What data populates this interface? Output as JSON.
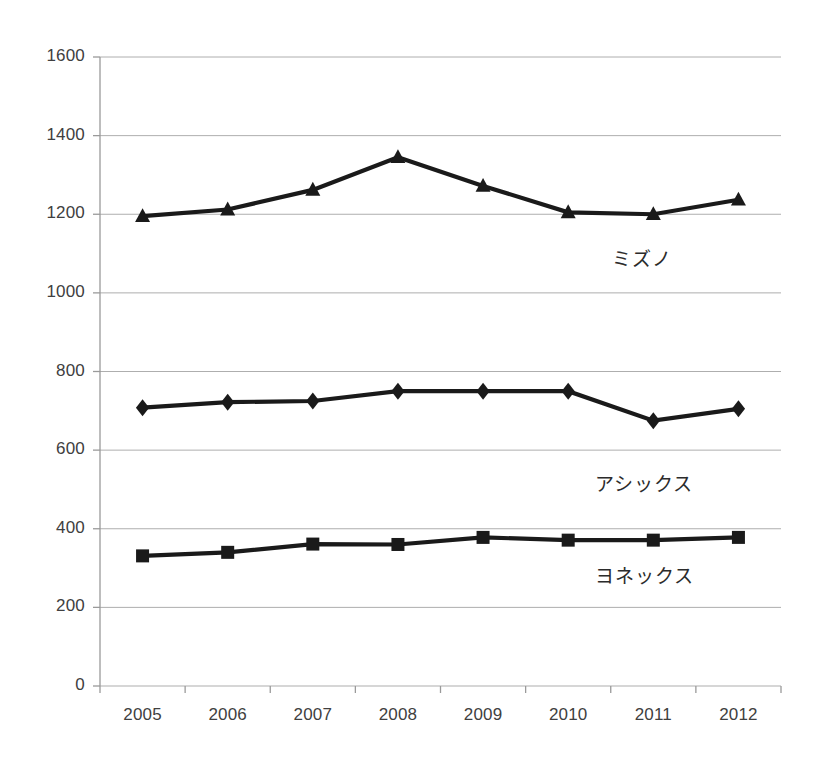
{
  "chart_data": {
    "type": "line",
    "title": "",
    "subtitle": "",
    "xlabel": "",
    "ylabel": "",
    "categories": [
      "2005",
      "2006",
      "2007",
      "2008",
      "2009",
      "2010",
      "2011",
      "2012"
    ],
    "x": [
      2005,
      2006,
      2007,
      2008,
      2009,
      2010,
      2011,
      2012
    ],
    "ylim": [
      0,
      1600
    ],
    "yticks": [
      0,
      200,
      400,
      600,
      800,
      1000,
      1200,
      1400,
      1600
    ],
    "ytick_labels": [
      "0",
      "200",
      "400",
      "600",
      "800",
      "1000",
      "1200",
      "1400",
      "1600"
    ],
    "grid": true,
    "grid_axis": "y",
    "legend": "inline-labels",
    "legend_position": "right-inline",
    "series": [
      {
        "name": "ミズノ",
        "marker": "triangle",
        "color": "#1a1a1a",
        "values": [
          1195,
          1212,
          1262,
          1345,
          1272,
          1205,
          1200,
          1237
        ],
        "label_x": 2011.1,
        "label_y": 1090
      },
      {
        "name": "アシックス",
        "marker": "diamond",
        "color": "#1a1a1a",
        "values": [
          708,
          722,
          725,
          750,
          750,
          750,
          675,
          705
        ],
        "label_x": 2010.9,
        "label_y": 520
      },
      {
        "name": "ヨネックス",
        "marker": "square",
        "color": "#1a1a1a",
        "values": [
          331,
          340,
          361,
          360,
          378,
          371,
          371,
          378
        ],
        "label_x": 2010.9,
        "label_y": 285
      }
    ]
  },
  "axes": {
    "y_tick_labels": [
      "1600",
      "1400",
      "1200",
      "1000",
      "800",
      "600",
      "400",
      "200",
      "0"
    ],
    "x_tick_labels": [
      "2005",
      "2006",
      "2007",
      "2008",
      "2009",
      "2010",
      "2011",
      "2012"
    ]
  },
  "series_labels": {
    "mizuno": "ミズノ",
    "asics": "アシックス",
    "yonex": "ヨネックス"
  },
  "colors": {
    "line": "#1a1a1a",
    "grid": "#aeaeae",
    "axis": "#9a9a9a",
    "text": "#404040"
  }
}
